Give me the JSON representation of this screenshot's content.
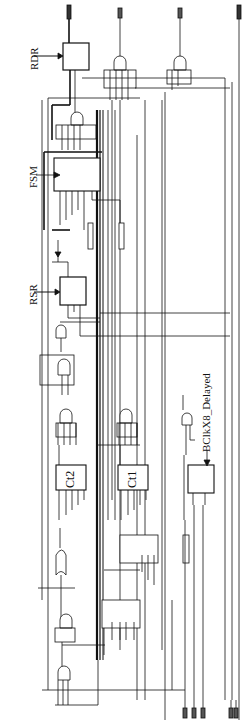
{
  "diagram": {
    "type": "digital-logic-schematic",
    "orientation": "rotated-90",
    "labels": {
      "rdr": "RDR",
      "fsm": "FSM",
      "rsr": "RSR",
      "ct2": "Ct2",
      "ct1": "Ct1",
      "bclk": "BClkX8_Delayed"
    },
    "blocks": [
      {
        "id": "rdr",
        "label": "RDR",
        "kind": "register"
      },
      {
        "id": "fsm",
        "label": "FSM",
        "kind": "state-machine"
      },
      {
        "id": "rsr",
        "label": "RSR",
        "kind": "shift-register"
      },
      {
        "id": "ct2",
        "label": "Ct2",
        "kind": "counter"
      },
      {
        "id": "ct1",
        "label": "Ct1",
        "kind": "counter"
      },
      {
        "id": "flipflop",
        "label": "",
        "kind": "flip-flop",
        "clock": "BClkX8_Delayed"
      },
      {
        "id": "mux1",
        "label": "",
        "kind": "mux"
      },
      {
        "id": "mux2",
        "label": "",
        "kind": "mux"
      }
    ],
    "colors": {
      "line": "#111111",
      "background": "#ffffff"
    }
  }
}
